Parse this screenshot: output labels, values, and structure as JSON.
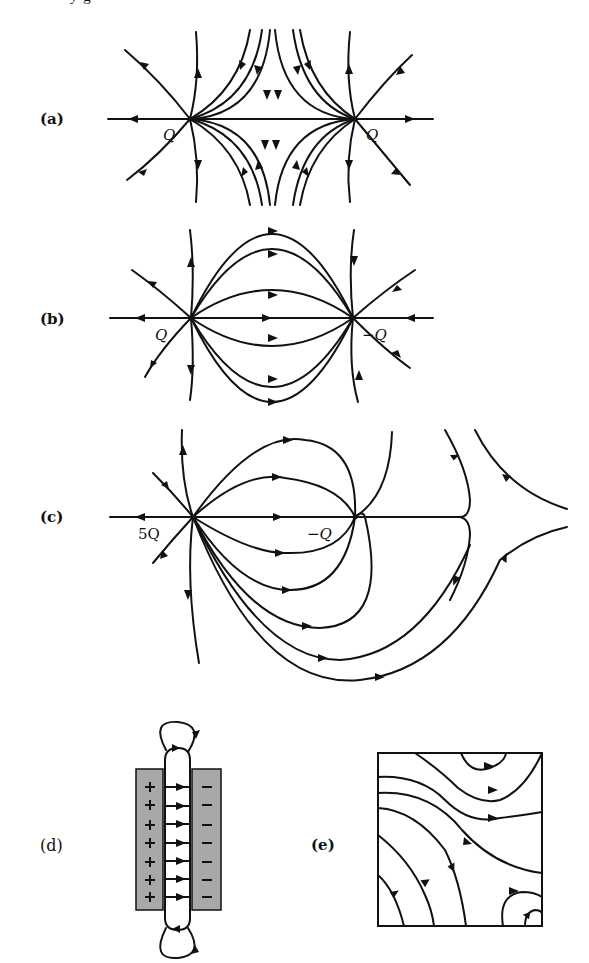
{
  "figure": {
    "caption_fragment": "y  g",
    "panels": [
      {
        "id": "a",
        "label": "(a)",
        "charges": [
          {
            "name": "left",
            "label": "Q"
          },
          {
            "name": "right",
            "label": "Q"
          }
        ],
        "description": "Field lines of two equal positive charges"
      },
      {
        "id": "b",
        "label": "(b)",
        "charges": [
          {
            "name": "left",
            "label": "Q"
          },
          {
            "name": "right",
            "label": "−Q"
          }
        ],
        "description": "Field lines of an electric dipole"
      },
      {
        "id": "c",
        "label": "(c)",
        "charges": [
          {
            "name": "left",
            "label": "5Q"
          },
          {
            "name": "right",
            "label": "−Q"
          }
        ],
        "description": "Field lines of charges 5Q and -Q"
      },
      {
        "id": "d",
        "label": "(d)",
        "plate_signs": {
          "left": "+",
          "right": "−"
        },
        "sign_count": 7,
        "arrow_count": 7,
        "description": "Parallel-plate capacitor with fringe field loops"
      },
      {
        "id": "e",
        "label": "(e)",
        "description": "Field lines inside a square region"
      }
    ]
  }
}
